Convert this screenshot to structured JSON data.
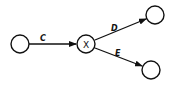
{
  "diagram": {
    "type": "directed-graph",
    "nodes": [
      {
        "id": "n0",
        "label": "",
        "cx": 20,
        "cy": 44
      },
      {
        "id": "x",
        "label": "X",
        "cx": 86,
        "cy": 44
      },
      {
        "id": "n2",
        "label": "",
        "cx": 155,
        "cy": 15
      },
      {
        "id": "n3",
        "label": "",
        "cx": 151,
        "cy": 70
      }
    ],
    "edges": [
      {
        "from": "n0",
        "to": "x",
        "label": "C"
      },
      {
        "from": "x",
        "to": "n2",
        "label": "D"
      },
      {
        "from": "x",
        "to": "n3",
        "label": "E"
      }
    ],
    "colors": {
      "stroke": "#111111",
      "background": "#ffffff"
    }
  }
}
